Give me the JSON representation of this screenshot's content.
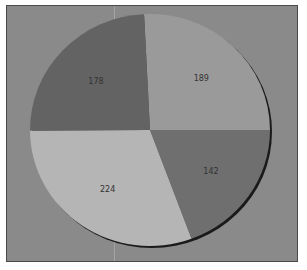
{
  "chart_data": {
    "type": "pie",
    "title": "",
    "labels": [
      "142",
      "224",
      "178",
      "189"
    ],
    "values": [
      142,
      224,
      178,
      189
    ],
    "colors": [
      "#6f6f6f",
      "#b5b5b5",
      "#636363",
      "#9a9a9a"
    ],
    "start_angle_deg": 0,
    "direction": "clockwise-from-3-oclock",
    "legend": "none",
    "show_values_on_slices": true
  },
  "style": {
    "background": "#8a8a8a",
    "border": "#4a4a4a",
    "shadow": "#1a1a1a"
  }
}
